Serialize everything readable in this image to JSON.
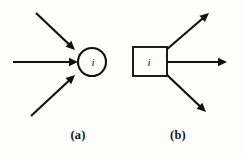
{
  "figure": {
    "background_color": "#fdfdfc",
    "ink_color": "#111111",
    "width": 243,
    "height": 154,
    "panels": [
      {
        "id": "a",
        "caption": "(a)",
        "caption_x": 78,
        "caption_y": 139,
        "node": {
          "type": "circle",
          "label": "i",
          "label_x": 93,
          "label_y": 66,
          "cx": 92,
          "cy": 62,
          "r": 14,
          "stroke_width": 2.1
        },
        "arrows": [
          {
            "name": "incoming-arrow-upper",
            "direction": "incoming",
            "x1": 36,
            "y1": 13,
            "x2": 75,
            "y2": 50,
            "stroke_width": 2.2,
            "head_size": 9
          },
          {
            "name": "incoming-arrow-middle",
            "direction": "incoming",
            "x1": 13,
            "y1": 62,
            "x2": 78,
            "y2": 62,
            "stroke_width": 2.2,
            "head_size": 9
          },
          {
            "name": "incoming-arrow-lower",
            "direction": "incoming",
            "x1": 31,
            "y1": 116,
            "x2": 75,
            "y2": 75,
            "stroke_width": 2.2,
            "head_size": 9
          }
        ]
      },
      {
        "id": "b",
        "caption": "(b)",
        "caption_x": 178,
        "caption_y": 139,
        "node": {
          "type": "square",
          "label": "i",
          "label_x": 149,
          "label_y": 66,
          "x": 133,
          "y": 47,
          "width": 34,
          "height": 29,
          "stroke_width": 1.9
        },
        "arrows": [
          {
            "name": "outgoing-arrow-upper",
            "direction": "outgoing",
            "x1": 166,
            "y1": 50,
            "x2": 209,
            "y2": 13,
            "stroke_width": 2.2,
            "head_size": 9
          },
          {
            "name": "outgoing-arrow-middle",
            "direction": "outgoing",
            "x1": 166,
            "y1": 62,
            "x2": 227,
            "y2": 62,
            "stroke_width": 2.2,
            "head_size": 9
          },
          {
            "name": "outgoing-arrow-lower",
            "direction": "outgoing",
            "x1": 166,
            "y1": 74,
            "x2": 206,
            "y2": 112,
            "stroke_width": 2.2,
            "head_size": 9
          }
        ]
      }
    ]
  }
}
